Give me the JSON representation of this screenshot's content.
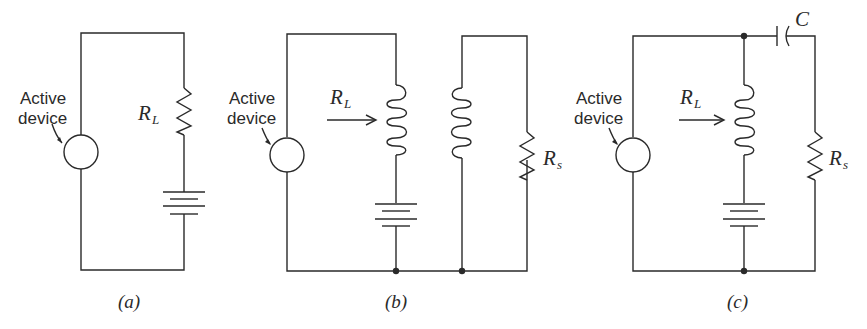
{
  "figure": {
    "panels": [
      {
        "id": "a",
        "caption": "(a)",
        "source_label": [
          "Active",
          "device"
        ],
        "load_label": "R",
        "load_sub": "L",
        "components": [
          "active-device-source",
          "load-resistor-RL",
          "battery"
        ]
      },
      {
        "id": "b",
        "caption": "(b)",
        "source_label": [
          "Active",
          "device"
        ],
        "load_label": "R",
        "load_sub": "L",
        "secondary_label": "R",
        "secondary_sub": "s",
        "components": [
          "active-device-source",
          "primary-inductor",
          "battery",
          "secondary-inductor",
          "resistor-Rs"
        ]
      },
      {
        "id": "c",
        "caption": "(c)",
        "source_label": [
          "Active",
          "device"
        ],
        "load_label": "R",
        "load_sub": "L",
        "secondary_label": "R",
        "secondary_sub": "s",
        "capacitor_label": "C",
        "components": [
          "active-device-source",
          "inductor",
          "battery",
          "capacitor-C",
          "resistor-Rs"
        ]
      }
    ]
  }
}
